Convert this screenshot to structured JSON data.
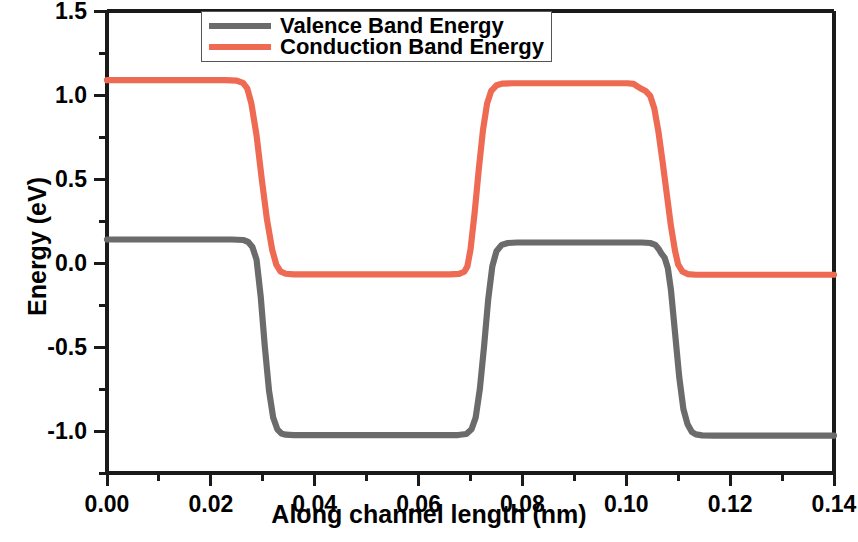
{
  "chart_data": {
    "type": "line",
    "title": "",
    "xlabel": "Along channel length (nm)",
    "ylabel": "Energy (eV)",
    "xlim": [
      0.0,
      0.14
    ],
    "ylim": [
      -1.25,
      1.5
    ],
    "xticks": [
      "0.00",
      "0.02",
      "0.04",
      "0.06",
      "0.08",
      "0.10",
      "0.12",
      "0.14"
    ],
    "xtick_values": [
      0.0,
      0.02,
      0.04,
      0.06,
      0.08,
      0.1,
      0.12,
      0.14
    ],
    "yticks": [
      "1.5",
      "1.0",
      "0.5",
      "0.0",
      "-0.5",
      "-1.0"
    ],
    "ytick_values": [
      1.5,
      1.0,
      0.5,
      0.0,
      -0.5,
      -1.0
    ],
    "grid": false,
    "legend_position": "top-center",
    "series": [
      {
        "name": "Valence Band Energy",
        "color": "#6b6b6b",
        "points": [
          [
            0.0,
            0.14
          ],
          [
            0.024,
            0.14
          ],
          [
            0.0262,
            0.137
          ],
          [
            0.0272,
            0.125
          ],
          [
            0.028,
            0.095
          ],
          [
            0.0288,
            0.02
          ],
          [
            0.0296,
            -0.2
          ],
          [
            0.0304,
            -0.5
          ],
          [
            0.0312,
            -0.76
          ],
          [
            0.032,
            -0.92
          ],
          [
            0.0328,
            -0.99
          ],
          [
            0.0336,
            -1.015
          ],
          [
            0.0344,
            -1.022
          ],
          [
            0.036,
            -1.025
          ],
          [
            0.064,
            -1.025
          ],
          [
            0.0676,
            -1.024
          ],
          [
            0.0692,
            -1.018
          ],
          [
            0.0702,
            -0.99
          ],
          [
            0.071,
            -0.92
          ],
          [
            0.0718,
            -0.75
          ],
          [
            0.0726,
            -0.5
          ],
          [
            0.0734,
            -0.22
          ],
          [
            0.0742,
            -0.02
          ],
          [
            0.075,
            0.07
          ],
          [
            0.076,
            0.108
          ],
          [
            0.0772,
            0.119
          ],
          [
            0.079,
            0.122
          ],
          [
            0.103,
            0.122
          ],
          [
            0.1046,
            0.119
          ],
          [
            0.1056,
            0.108
          ],
          [
            0.1062,
            0.085
          ],
          [
            0.1068,
            0.055
          ],
          [
            0.1074,
            0.03
          ],
          [
            0.108,
            -0.03
          ],
          [
            0.1086,
            -0.16
          ],
          [
            0.1094,
            -0.42
          ],
          [
            0.1102,
            -0.68
          ],
          [
            0.111,
            -0.87
          ],
          [
            0.1118,
            -0.96
          ],
          [
            0.1126,
            -1.005
          ],
          [
            0.1134,
            -1.02
          ],
          [
            0.1146,
            -1.026
          ],
          [
            0.117,
            -1.027
          ],
          [
            0.14,
            -1.027
          ]
        ]
      },
      {
        "name": "Conduction Band Energy",
        "color": "#ee6a52",
        "points": [
          [
            0.0,
            1.088
          ],
          [
            0.0228,
            1.088
          ],
          [
            0.025,
            1.085
          ],
          [
            0.0262,
            1.072
          ],
          [
            0.027,
            1.04
          ],
          [
            0.0278,
            0.95
          ],
          [
            0.0288,
            0.76
          ],
          [
            0.0298,
            0.5
          ],
          [
            0.0308,
            0.26
          ],
          [
            0.0318,
            0.08
          ],
          [
            0.0326,
            -0.01
          ],
          [
            0.0334,
            -0.05
          ],
          [
            0.0344,
            -0.064
          ],
          [
            0.036,
            -0.068
          ],
          [
            0.066,
            -0.068
          ],
          [
            0.0678,
            -0.065
          ],
          [
            0.0688,
            -0.052
          ],
          [
            0.0694,
            -0.02
          ],
          [
            0.07,
            0.08
          ],
          [
            0.0708,
            0.3
          ],
          [
            0.0716,
            0.56
          ],
          [
            0.0724,
            0.79
          ],
          [
            0.0732,
            0.95
          ],
          [
            0.074,
            1.025
          ],
          [
            0.075,
            1.058
          ],
          [
            0.0762,
            1.068
          ],
          [
            0.078,
            1.07
          ],
          [
            0.1002,
            1.07
          ],
          [
            0.1014,
            1.066
          ],
          [
            0.1022,
            1.05
          ],
          [
            0.103,
            1.035
          ],
          [
            0.1038,
            1.022
          ],
          [
            0.1046,
            0.995
          ],
          [
            0.1054,
            0.92
          ],
          [
            0.1062,
            0.78
          ],
          [
            0.107,
            0.6
          ],
          [
            0.1078,
            0.41
          ],
          [
            0.1086,
            0.22
          ],
          [
            0.1094,
            0.07
          ],
          [
            0.11,
            -0.01
          ],
          [
            0.1108,
            -0.05
          ],
          [
            0.1118,
            -0.066
          ],
          [
            0.1134,
            -0.07
          ],
          [
            0.14,
            -0.07
          ]
        ]
      }
    ]
  },
  "legend": {
    "items": [
      {
        "label": "Valence Band Energy",
        "color": "#6b6b6b"
      },
      {
        "label": "Conduction Band Energy",
        "color": "#ee6a52"
      }
    ]
  },
  "axes": {
    "x_title": "Along channel length (nm)",
    "y_title": "Energy (eV)"
  }
}
